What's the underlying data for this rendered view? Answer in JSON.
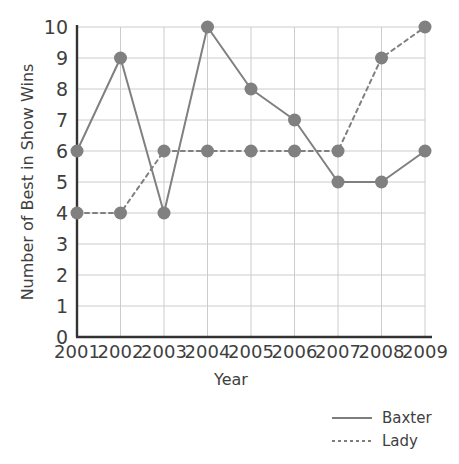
{
  "chart_data": {
    "type": "line",
    "title": "",
    "xlabel": "Year",
    "ylabel": "Number of Best in Show Wins",
    "categories": [
      "2001",
      "2002",
      "2003",
      "2004",
      "2005",
      "2006",
      "2007",
      "2008",
      "2009"
    ],
    "x_tick_labels": [
      "2001",
      "2002",
      "2003",
      "2004",
      "2005",
      "2006",
      "2007",
      "2008",
      "2009"
    ],
    "y_tick_labels": [
      "0",
      "1",
      "2",
      "3",
      "4",
      "5",
      "6",
      "7",
      "8",
      "9",
      "10"
    ],
    "ylim": [
      0,
      10
    ],
    "grid": true,
    "legend_position": "bottom-right",
    "series": [
      {
        "name": "Baxter",
        "style": "solid",
        "color": "#808080",
        "values": [
          6,
          9,
          4,
          10,
          8,
          7,
          5,
          5,
          6
        ]
      },
      {
        "name": "Lady",
        "style": "dotted",
        "color": "#808080",
        "values": [
          4,
          4,
          6,
          6,
          6,
          6,
          6,
          9,
          10
        ]
      }
    ]
  },
  "legend": {
    "items": [
      {
        "label": "Baxter",
        "style": "solid"
      },
      {
        "label": "Lady",
        "style": "dotted"
      }
    ]
  },
  "colors": {
    "marker": "#808080",
    "line": "#7d7d7d",
    "grid": "#cccccc",
    "axis": "#333333",
    "text": "#3f3f3f"
  }
}
